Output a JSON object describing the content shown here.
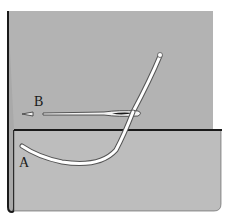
{
  "diagram": {
    "type": "sewing-illustration",
    "labels": {
      "point_a": "A",
      "point_b": "B"
    },
    "colors": {
      "background": "#ffffff",
      "fabric_upper": "#b3b3b3",
      "fabric_lower": "#bdbdbd",
      "outline": "#1a1a1a",
      "thread": "#ffffff",
      "needle": "#f2f2f2"
    }
  }
}
